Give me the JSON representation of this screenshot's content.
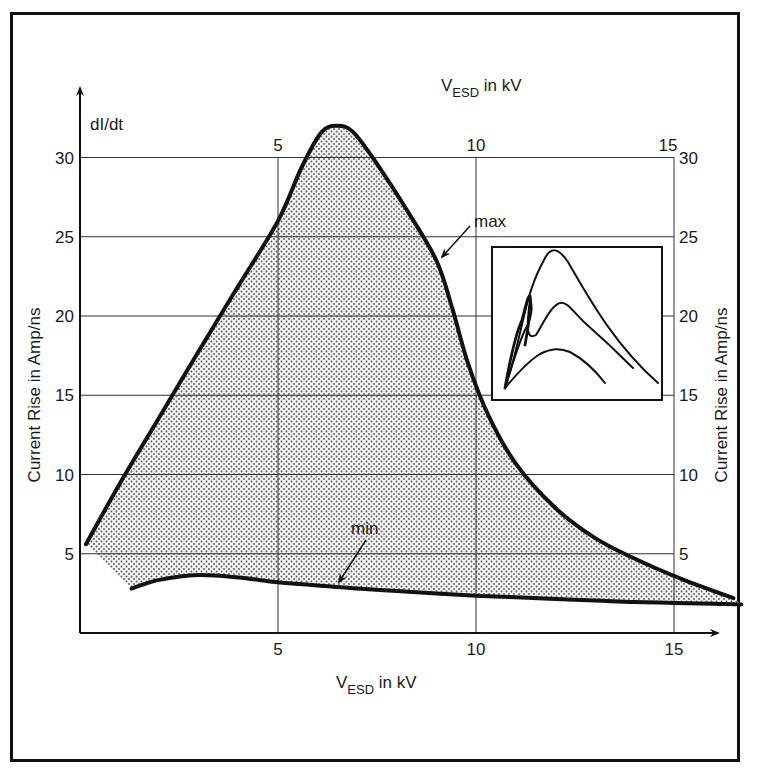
{
  "chart_data": {
    "type": "area",
    "title": "",
    "xlabel_bottom": {
      "main": "V",
      "sub": "ESD",
      "rest": " in kV"
    },
    "xlabel_top": {
      "main": "V",
      "sub": "ESD",
      "rest": " in kV"
    },
    "ylabel_left": "Current Rise in Amp/ns",
    "ylabel_right": "Current Rise in Amp/ns",
    "y_axis_symbol": "dI/dt",
    "xlim": [
      0,
      17
    ],
    "ylim": [
      0,
      32
    ],
    "x_ticks": [
      5,
      10,
      15
    ],
    "x_tick_labels": [
      "5",
      "10",
      "15"
    ],
    "y_ticks": [
      5,
      10,
      15,
      20,
      25,
      30
    ],
    "y_tick_labels": [
      "5",
      "10",
      "15",
      "20",
      "25",
      "30"
    ],
    "grid": true,
    "series": [
      {
        "name": "max",
        "x": [
          0.15,
          1.0,
          2.0,
          3.0,
          4.0,
          5.0,
          5.6,
          6.1,
          6.5,
          6.9,
          7.5,
          8.3,
          9.0,
          9.4,
          9.8,
          10.3,
          11.0,
          12.0,
          13.0,
          14.0,
          15.2,
          16.5
        ],
        "y": [
          5.6,
          9.4,
          13.6,
          17.8,
          21.9,
          26.0,
          29.4,
          31.6,
          32.0,
          31.6,
          29.6,
          26.5,
          23.5,
          20.5,
          17.0,
          13.8,
          10.7,
          7.9,
          6.0,
          4.7,
          3.4,
          2.2
        ]
      },
      {
        "name": "min",
        "x": [
          1.3,
          2.0,
          3.0,
          4.0,
          5.0,
          6.0,
          7.0,
          8.0,
          9.0,
          10.0,
          11.0,
          12.0,
          13.0,
          14.0,
          15.0,
          16.0,
          16.7
        ],
        "y": [
          2.8,
          3.35,
          3.65,
          3.5,
          3.2,
          3.0,
          2.8,
          2.65,
          2.5,
          2.35,
          2.25,
          2.15,
          2.05,
          1.95,
          1.9,
          1.85,
          1.8
        ]
      }
    ],
    "annotations": [
      {
        "text": "max",
        "points_to": "max",
        "at_x": 9.0
      },
      {
        "text": "min",
        "points_to": "min",
        "at_x": 8.5
      }
    ],
    "inset": {
      "description": "inset showing current waveforms",
      "curves": 3
    }
  }
}
